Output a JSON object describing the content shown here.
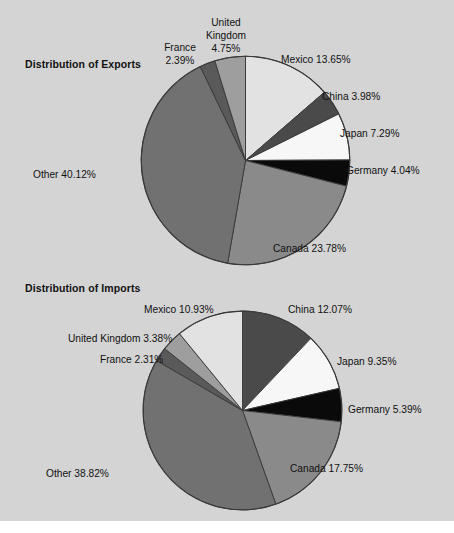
{
  "figure": {
    "background_color": "#d4d4d4",
    "text_color": "#111111"
  },
  "exports": {
    "title": "Distribution of Exports",
    "labels": {
      "mexico": "Mexico 13.65%",
      "china": "China 3.98%",
      "japan": "Japan 7.29%",
      "germany": "Germany 4.04%",
      "canada": "Canada 23.78%",
      "other": "Other 40.12%",
      "uk": "United Kingdom 4.75%",
      "france": "France 2.39%"
    }
  },
  "imports": {
    "title": "Distribution of Imports",
    "labels": {
      "china": "China 12.07%",
      "japan": "Japan 9.35%",
      "germany": "Germany 5.39%",
      "canada": "Canada 17.75%",
      "other": "Other 38.82%",
      "mexico": "Mexico 10.93%",
      "uk": "United Kingdom 3.38%",
      "france": "France 2.31%"
    }
  },
  "chart_data": [
    {
      "type": "pie",
      "title": "Distribution of Exports",
      "start_angle_deg": 0,
      "direction": "clockwise",
      "legend": "none",
      "labels": [
        "Mexico",
        "China",
        "Japan",
        "Germany",
        "Canada",
        "Other",
        "France",
        "United Kingdom"
      ],
      "values": [
        13.65,
        3.98,
        7.29,
        4.04,
        23.78,
        40.12,
        2.39,
        4.75
      ],
      "unit": "percent",
      "colors": [
        "#e2e2e2",
        "#4a4a4a",
        "#f7f7f7",
        "#0a0a0a",
        "#8a8a8a",
        "#717171",
        "#5a5a5a",
        "#9e9e9e"
      ],
      "data_labels": [
        "Mexico 13.65%",
        "China 3.98%",
        "Japan 7.29%",
        "Germany 4.04%",
        "Canada 23.78%",
        "Other 40.12%",
        "France 2.39%",
        "United Kingdom 4.75%"
      ]
    },
    {
      "type": "pie",
      "title": "Distribution of Imports",
      "start_angle_deg": 0,
      "direction": "clockwise",
      "legend": "none",
      "labels": [
        "China",
        "Japan",
        "Germany",
        "Canada",
        "Other",
        "France",
        "United Kingdom",
        "Mexico"
      ],
      "values": [
        12.07,
        9.35,
        5.39,
        17.75,
        38.82,
        2.31,
        3.38,
        10.93
      ],
      "unit": "percent",
      "colors": [
        "#4a4a4a",
        "#f7f7f7",
        "#0a0a0a",
        "#8a8a8a",
        "#717171",
        "#5a5a5a",
        "#9e9e9e",
        "#e2e2e2"
      ],
      "data_labels": [
        "China 12.07%",
        "Japan 9.35%",
        "Germany 5.39%",
        "Canada 17.75%",
        "Other 38.82%",
        "France 2.31%",
        "United Kingdom 3.38%",
        "Mexico 10.93%"
      ]
    }
  ]
}
